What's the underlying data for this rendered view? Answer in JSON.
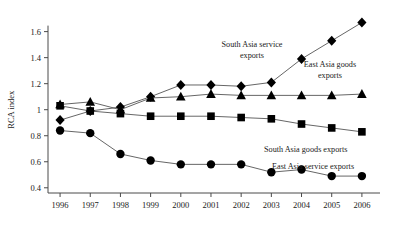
{
  "chart_data": {
    "type": "line",
    "title": "",
    "xlabel": "",
    "ylabel": "RCA index",
    "x": [
      1996,
      1997,
      1998,
      1999,
      2000,
      2001,
      2002,
      2003,
      2004,
      2005,
      2006
    ],
    "xtick_labels": [
      "1996",
      "1997",
      "1998",
      "1999",
      "2000",
      "2001",
      "2002",
      "2003",
      "2004",
      "2005",
      "2006"
    ],
    "ytick_labels": [
      "0.4",
      "0.6",
      "0.8",
      "1",
      "1.2",
      "1.4",
      "1.6"
    ],
    "ytick_values": [
      0.4,
      0.6,
      0.8,
      1.0,
      1.2,
      1.4,
      1.6
    ],
    "ylim": [
      0.36,
      1.72
    ],
    "xlim": [
      1995.6,
      2006.6
    ],
    "grid": false,
    "legend_position": "inline-annotations",
    "series": [
      {
        "name": "South Asia service exports",
        "marker": "diamond",
        "values": [
          0.92,
          0.99,
          1.02,
          1.1,
          1.19,
          1.19,
          1.18,
          1.21,
          1.39,
          1.53,
          1.67
        ]
      },
      {
        "name": "East Asia goods exports",
        "marker": "triangle",
        "values": [
          1.04,
          1.06,
          1.0,
          1.09,
          1.1,
          1.12,
          1.11,
          1.11,
          1.11,
          1.11,
          1.12
        ]
      },
      {
        "name": "South Asia goods exports",
        "marker": "square",
        "values": [
          1.03,
          0.99,
          0.97,
          0.95,
          0.95,
          0.95,
          0.94,
          0.93,
          0.89,
          0.86,
          0.83
        ]
      },
      {
        "name": "East Asia service exports",
        "marker": "circle",
        "values": [
          0.84,
          0.82,
          0.66,
          0.61,
          0.58,
          0.58,
          0.58,
          0.52,
          0.54,
          0.49,
          0.49
        ]
      }
    ],
    "annotations": [
      {
        "id": "ann-south-asia-service",
        "lines": [
          "South Asia service",
          "exports"
        ]
      },
      {
        "id": "ann-east-asia-goods",
        "lines": [
          "East Asia goods",
          "exports"
        ]
      },
      {
        "id": "ann-south-asia-goods",
        "lines": [
          "South Asia goods exports"
        ]
      },
      {
        "id": "ann-east-asia-service",
        "lines": [
          "East Asia service exports"
        ]
      }
    ],
    "colors": {
      "marker": "#000000",
      "line": "#555555",
      "axis": "#4a4a4a",
      "text": "#1a1a1a",
      "background": "#ffffff"
    }
  }
}
